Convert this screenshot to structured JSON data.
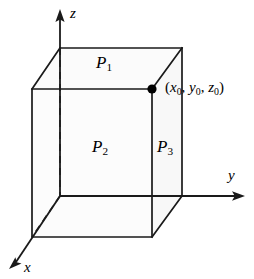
{
  "figure": {
    "background_color": "#ffffff",
    "line_color": "#1a1a1a",
    "dot_color": "#000000",
    "width": 254,
    "height": 279
  },
  "axes": {
    "z_label": "z",
    "y_label": "y",
    "x_label": "x"
  },
  "faces": {
    "p1_base": "P",
    "p1_sub": "1",
    "p2_base": "P",
    "p2_sub": "2",
    "p3_base": "P",
    "p3_sub": "3"
  },
  "point": {
    "open_paren": "(",
    "x_base": "x",
    "x_sub": "0",
    "sep1": ", ",
    "y_base": "y",
    "y_sub": "0",
    "sep2": ", ",
    "z_base": "z",
    "z_sub": "0",
    "close_paren": ")",
    "full_label": "(x0, y0, z0)"
  },
  "geometry": {
    "origin": [
      60,
      196
    ],
    "front_top_left": [
      32,
      89
    ],
    "front_top_right": [
      152,
      89
    ],
    "front_bottom_left": [
      32,
      237
    ],
    "front_bottom_right": [
      152,
      237
    ],
    "back_top_left": [
      60,
      48
    ],
    "back_top_right": [
      182,
      48
    ],
    "back_bottom_right": [
      182,
      196
    ],
    "z_axis_tip": [
      60,
      10
    ],
    "y_axis_tip": [
      244,
      196
    ],
    "x_axis_tip": [
      10,
      268
    ],
    "marked_point": [
      152,
      89
    ]
  }
}
